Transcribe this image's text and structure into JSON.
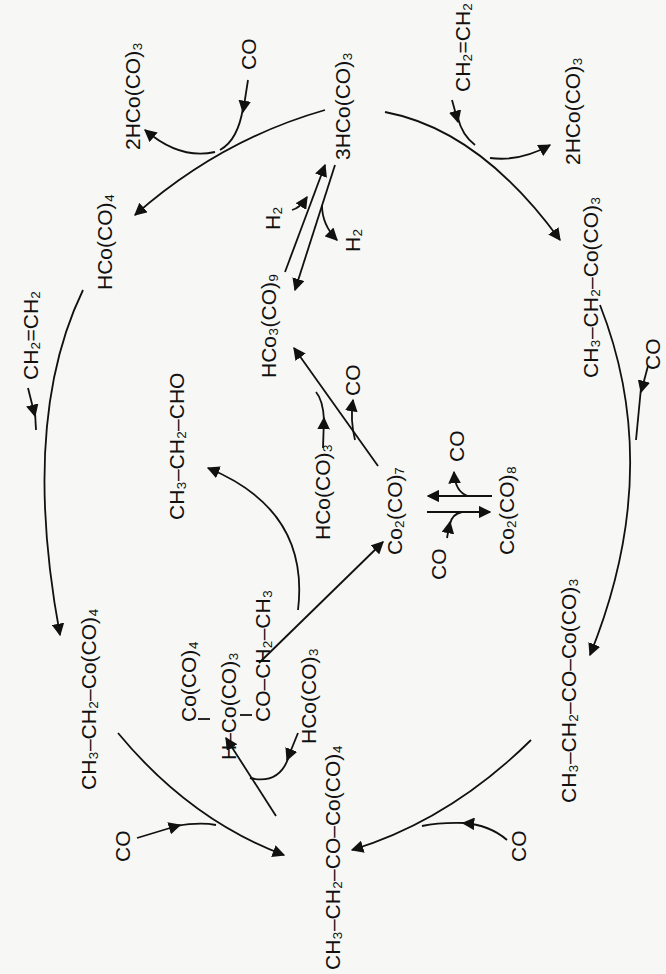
{
  "diagram": {
    "type": "reaction-cycle",
    "orientation": "rotated-90-ccw",
    "colors": {
      "ink": "#111111",
      "background": "#f7f7f5"
    },
    "species": {
      "hco4_top": {
        "base": "HCo(CO)",
        "sub": "4"
      },
      "co_top_left": {
        "base": "CO"
      },
      "two_hco3_left": {
        "base": "2HCo(CO)",
        "sub": "3"
      },
      "three_hco3": {
        "base": "3HCo(CO)",
        "sub": "3"
      },
      "ethylene_top_right": {
        "base": "CH",
        "mid": "=CH",
        "sub1": "2",
        "sub2": "2"
      },
      "two_hco3_right": {
        "base": "2HCo(CO)",
        "sub": "3"
      },
      "ethyl_co3": {
        "text": "CH3–CH2–Co(CO)3"
      },
      "co_right_upper": {
        "base": "CO"
      },
      "propionyl_co3": {
        "text": "CH3–CH2–CO–Co(CO)3"
      },
      "co_bottom_right": {
        "base": "CO"
      },
      "propionyl_co4": {
        "text": "CH3–CH2–CO–Co(CO)4"
      },
      "co_bottom_left": {
        "base": "CO"
      },
      "ethyl_co4": {
        "text": "CH3–CH2–Co(CO)4"
      },
      "ethylene_left": {
        "text": "CH2=CH2"
      },
      "h2_in": {
        "base": "H",
        "sub": "2"
      },
      "h2_out": {
        "base": "H",
        "sub": "2"
      },
      "hco3co9": {
        "text": "HCo3(CO)9"
      },
      "hco3_center": {
        "text": "HCo(CO)3"
      },
      "co_center_out": {
        "base": "CO"
      },
      "propanal": {
        "text": "CH3–CH2–CHO"
      },
      "co2co7": {
        "text": "Co2(CO)7"
      },
      "co2co8": {
        "text": "Co2(CO)8"
      },
      "co_eq_in": {
        "base": "CO"
      },
      "co_eq_out": {
        "base": "CO"
      },
      "dinuclear_co4": {
        "text": "Co(CO)4"
      },
      "dinuclear_hco3": {
        "text": "H–Co(CO)3"
      },
      "dinuclear_acyl": {
        "text": "CO–CH2–CH3"
      },
      "hco3_lower": {
        "text": "HCo(CO)3"
      }
    },
    "labels": {
      "hco4_top": "HCo(CO)₄",
      "co_top_left": "CO",
      "two_hco3_left": "2HCo(CO)₃",
      "three_hco3": "3HCo(CO)₃",
      "ethylene_top_right": "CH₂=CH₂",
      "two_hco3_right": "2HCo(CO)₃",
      "ethyl_co3": "CH₃–CH₂–Co(CO)₃",
      "co_right_upper": "CO",
      "propionyl_co3": "CH₃–CH₂–CO–Co(CO)₃",
      "co_bottom_right": "CO",
      "propionyl_co4": "CH₃–CH₂–CO–Co(CO)₄",
      "co_bottom_left": "CO",
      "ethyl_co4": "CH₃–CH₂–Co(CO)₄",
      "ethylene_left": "CH₂=CH₂",
      "h2_in": "H₂",
      "h2_out": "H₂",
      "hco3co9": "HCo₃(CO)₉",
      "hco3_center": "HCo(CO)₃",
      "co_center_out": "CO",
      "propanal": "CH₃–CH₂–CHO",
      "co2co7": "Co₂(CO)₇",
      "co2co8": "Co₂(CO)₈",
      "co_eq_in": "CO",
      "co_eq_out": "CO",
      "dinuclear_co4": "Co(CO)₄",
      "dinuclear_hco3": "H–Co(CO)₃",
      "dinuclear_acyl": "CO–CH₂–CH₃",
      "hco3_lower": "HCo(CO)₃"
    }
  }
}
